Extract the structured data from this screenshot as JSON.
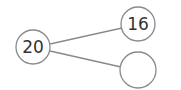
{
  "diagram": {
    "type": "number-bond",
    "whole": {
      "label": "20",
      "cx": 33,
      "cy": 47,
      "r": 17
    },
    "parts": [
      {
        "label": "16",
        "cx": 138,
        "cy": 24,
        "r": 17
      },
      {
        "label": "",
        "cx": 138,
        "cy": 70,
        "r": 18
      }
    ],
    "colors": {
      "stroke": "#8a8a8a",
      "text": "#333333",
      "background": "#ffffff"
    }
  }
}
